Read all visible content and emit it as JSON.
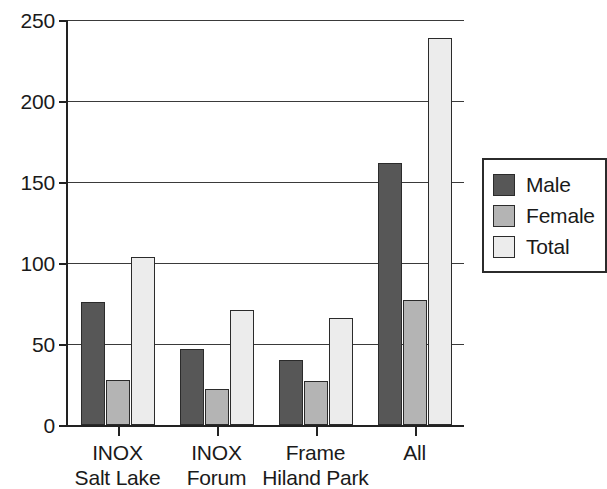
{
  "chart_data": {
    "type": "bar",
    "title": "",
    "subtitle": "",
    "xlabel": "",
    "ylabel": "",
    "ylim": [
      0,
      250
    ],
    "ytick_labels": [
      "0",
      "50",
      "100",
      "150",
      "200",
      "250"
    ],
    "ytick_values": [
      0,
      50,
      100,
      150,
      200,
      250
    ],
    "grid": true,
    "legend_position": "right",
    "categories": [
      "INOX\nSalt Lake",
      "INOX\nForum",
      "Frame\nHiland Park",
      "All"
    ],
    "category_lines": [
      [
        "INOX",
        "Salt Lake"
      ],
      [
        "INOX",
        "Forum"
      ],
      [
        "Frame",
        "Hiland Park"
      ],
      [
        "All",
        ""
      ]
    ],
    "series": [
      {
        "name": "Male",
        "color": "#575757",
        "values": [
          76,
          47,
          40,
          162
        ]
      },
      {
        "name": "Female",
        "color": "#b4b4b4",
        "values": [
          28,
          22,
          27,
          77
        ]
      },
      {
        "name": "Total",
        "color": "#ececec",
        "values": [
          104,
          71,
          66,
          239
        ]
      }
    ]
  },
  "legend": {
    "items": [
      {
        "label": "Male",
        "swatch": "male-swatch"
      },
      {
        "label": "Female",
        "swatch": "female-swatch"
      },
      {
        "label": "Total",
        "swatch": "total-swatch"
      }
    ]
  },
  "axes": {
    "y_min": 0,
    "y_max": 250,
    "y_step": 50
  }
}
